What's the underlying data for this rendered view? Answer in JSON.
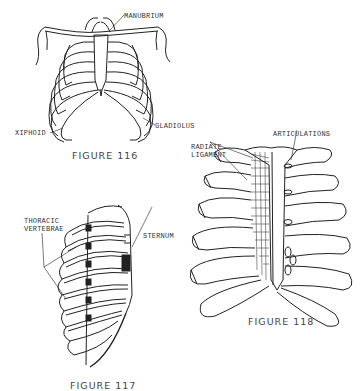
{
  "figures": [
    {
      "id": "figure-116",
      "caption": "FIGURE 116",
      "view": "anterior rib cage with shoulders",
      "labels": {
        "manubrium": "MANUBRIUM",
        "xiphoid": "XIPHOID",
        "gladiolus": "GLADIOLUS"
      }
    },
    {
      "id": "figure-117",
      "caption": "FIGURE 117",
      "view": "lateral oblique rib cage",
      "labels": {
        "thoracic_vertebrae": "THORACIC\nVERTEBRAE",
        "sternum": "STERNUM"
      }
    },
    {
      "id": "figure-118",
      "caption": "FIGURE 118",
      "view": "sternum with costal cartilages",
      "labels": {
        "radiate_ligament": "RADIATE\nLIGAMENT",
        "articulations": "ARTICULATIONS"
      }
    }
  ],
  "colors": {
    "ink": "#222222",
    "background": "#ffffff"
  }
}
